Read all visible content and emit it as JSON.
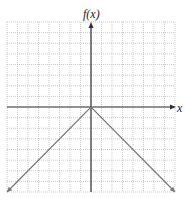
{
  "chart_data": {
    "type": "line",
    "title": "",
    "xlabel": "x",
    "ylabel": "f(x)",
    "xlim": [
      -8,
      8
    ],
    "ylim": [
      -8,
      8
    ],
    "grid": true,
    "grid_step": 1,
    "series": [
      {
        "name": "f(x) = -|x|",
        "x": [
          -8,
          0,
          8
        ],
        "y": [
          -8,
          0,
          -8
        ],
        "color": "#777777",
        "arrows_at_ends": true
      }
    ]
  },
  "labels": {
    "y_axis": "f(x)",
    "x_axis": "x"
  },
  "colors": {
    "grid": "#bbbbbb",
    "axis": "#333333",
    "curve": "#777777"
  }
}
